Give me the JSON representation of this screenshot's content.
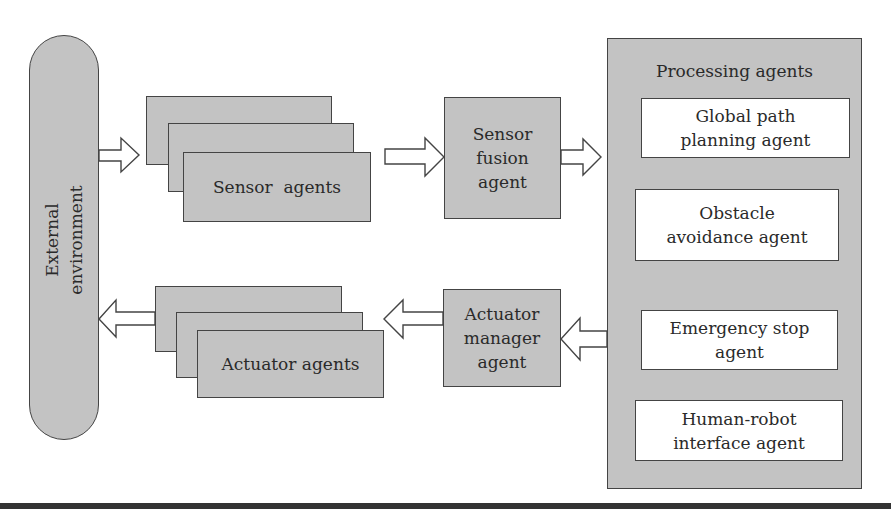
{
  "diagram": {
    "external": {
      "label": "External\nenvironment"
    },
    "sensor_agents": {
      "label": "Sensor  agents",
      "stack_count": 3
    },
    "sensor_fusion": {
      "label": "Sensor\nfusion\nagent"
    },
    "processing": {
      "title": "Processing agents",
      "children": [
        {
          "label": "Global path\nplanning agent"
        },
        {
          "label": "Obstacle\navoidance agent"
        },
        {
          "label": "Emergency stop\nagent"
        },
        {
          "label": "Human-robot\ninterface agent"
        }
      ]
    },
    "actuator_manager": {
      "label": "Actuator\nmanager\nagent"
    },
    "actuator_agents": {
      "label": "Actuator agents",
      "stack_count": 3
    },
    "flows": [
      {
        "from": "External environment",
        "to": "Sensor agents",
        "direction": "right"
      },
      {
        "from": "Sensor agents",
        "to": "Sensor fusion agent",
        "direction": "right"
      },
      {
        "from": "Sensor fusion agent",
        "to": "Processing agents",
        "direction": "right"
      },
      {
        "from": "Processing agents",
        "to": "Actuator manager agent",
        "direction": "left"
      },
      {
        "from": "Actuator manager agent",
        "to": "Actuator agents",
        "direction": "left"
      },
      {
        "from": "Actuator agents",
        "to": "External environment",
        "direction": "left"
      }
    ],
    "colors": {
      "box_fill": "#c3c3c3",
      "inner_fill": "#ffffff",
      "stroke": "#444444",
      "rule": "#333333"
    }
  }
}
